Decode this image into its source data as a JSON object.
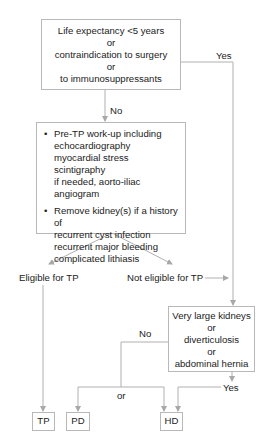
{
  "flowchart": {
    "top_box": {
      "lines": [
        "Life expectancy <5 years",
        "or",
        "contraindication to surgery",
        "or",
        "to immunosuppressants"
      ]
    },
    "labels": {
      "yes_top": "Yes",
      "no_top": "No",
      "eligible": "Eligible for TP",
      "not_eligible": "Not eligible for TP",
      "no_right": "No",
      "or": "or",
      "yes_bottom": "Yes"
    },
    "workup_box": {
      "bullet": "•",
      "items": [
        {
          "lines": [
            "Pre-TP work-up including",
            "echocardiography",
            "myocardial stress scintigraphy",
            "if needed, aorto-iliac angiogram"
          ]
        },
        {
          "lines": [
            "Remove kidney(s) if a history of",
            "recurrent cyst infection",
            "recurrent major bleeding",
            "complicated lithiasis"
          ]
        }
      ]
    },
    "condition_box": {
      "lines": [
        "Very large kidneys",
        "or",
        "diverticulosis",
        "or",
        "abdominal hernia"
      ]
    },
    "outcomes": {
      "tp": "TP",
      "pd": "PD",
      "hd": "HD"
    },
    "colors": {
      "line": "#b0b0b0",
      "border": "#b8b8b8",
      "text": "#222222"
    }
  }
}
